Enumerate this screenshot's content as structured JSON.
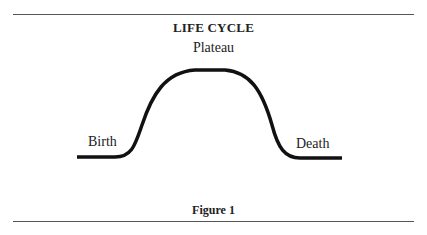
{
  "diagram": {
    "title": "LIFE CYCLE",
    "labels": {
      "start": "Birth",
      "peak": "Plateau",
      "end": "Death"
    },
    "caption": "Figure 1",
    "curve_color": "#111111",
    "rule_color": "#555555"
  }
}
